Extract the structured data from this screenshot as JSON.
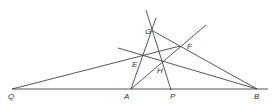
{
  "diagram": {
    "type": "geometry-construction",
    "points": {
      "Q": {
        "label": "Q",
        "x": 12,
        "y": 89,
        "lx": 8,
        "ly": 99
      },
      "A": {
        "label": "A",
        "x": 131,
        "y": 89,
        "lx": 124,
        "ly": 99
      },
      "P": {
        "label": "P",
        "x": 171,
        "y": 89,
        "lx": 170,
        "ly": 99
      },
      "B": {
        "label": "B",
        "x": 257,
        "y": 89,
        "lx": 254,
        "ly": 99
      },
      "G": {
        "label": "G",
        "x": 153,
        "y": 31,
        "lx": 145,
        "ly": 34
      },
      "F": {
        "label": "F",
        "x": 180,
        "y": 46,
        "lx": 187,
        "ly": 49
      },
      "E": {
        "label": "E",
        "x": 143,
        "y": 56,
        "lx": 132,
        "ly": 67
      },
      "H": {
        "label": "H",
        "x": 162,
        "y": 62,
        "lx": 157,
        "ly": 73
      }
    },
    "lines": [
      {
        "name": "baseline-QB",
        "x1": 12,
        "y1": 89,
        "x2": 268,
        "y2": 89
      },
      {
        "name": "line-QEF",
        "x1": 12,
        "y1": 89,
        "x2": 180,
        "y2": 46
      },
      {
        "name": "line-AEG",
        "x1": 131,
        "y1": 89,
        "x2": 156,
        "y2": 18
      },
      {
        "name": "line-AHF",
        "x1": 131,
        "y1": 89,
        "x2": 206,
        "y2": 25
      },
      {
        "name": "line-GB",
        "x1": 153,
        "y1": 31,
        "x2": 257,
        "y2": 89
      },
      {
        "name": "line-EHB",
        "x1": 118,
        "y1": 48,
        "x2": 257,
        "y2": 89
      },
      {
        "name": "line-GHP",
        "x1": 146,
        "y1": 10,
        "x2": 171,
        "y2": 90
      }
    ]
  }
}
